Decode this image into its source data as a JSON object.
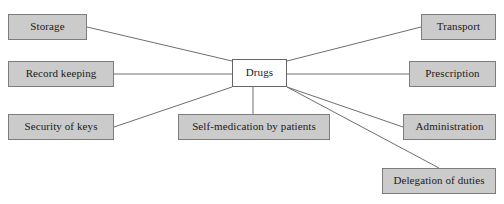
{
  "diagram": {
    "type": "spider-diagram",
    "title": "Drugs",
    "canvas": {
      "width": 504,
      "height": 204,
      "background": "#ffffff"
    },
    "style": {
      "node_fill": "#cbcbcb",
      "node_border": "#7d7d7d",
      "center_fill": "#ffffff",
      "center_border": "#666666",
      "edge_color": "#6e6e6e",
      "text_color": "#1a1a1a"
    },
    "center": {
      "label": "Drugs",
      "x": 232,
      "y": 59,
      "width": 55,
      "height": 28
    },
    "nodes": [
      {
        "id": "storage",
        "label": "Storage",
        "x": 8,
        "y": 14,
        "width": 79,
        "height": 26
      },
      {
        "id": "record-keeping",
        "label": "Record keeping",
        "x": 8,
        "y": 61,
        "width": 106,
        "height": 26
      },
      {
        "id": "security-of-keys",
        "label": "Security of keys",
        "x": 8,
        "y": 114,
        "width": 106,
        "height": 26
      },
      {
        "id": "self-medication",
        "label": "Self-medication by patients",
        "x": 178,
        "y": 114,
        "width": 152,
        "height": 26
      },
      {
        "id": "transport",
        "label": "Transport",
        "x": 421,
        "y": 14,
        "width": 75,
        "height": 26
      },
      {
        "id": "prescription",
        "label": "Prescription",
        "x": 409,
        "y": 61,
        "width": 87,
        "height": 26
      },
      {
        "id": "administration",
        "label": "Administration",
        "x": 403,
        "y": 114,
        "width": 93,
        "height": 26
      },
      {
        "id": "delegation",
        "label": "Delegation of duties",
        "x": 382,
        "y": 168,
        "width": 114,
        "height": 26
      }
    ],
    "edges": [
      {
        "id": "edge-storage",
        "from": "drugs",
        "to": "storage",
        "x1": 232,
        "y1": 61,
        "x2": 87,
        "y2": 27
      },
      {
        "id": "edge-record-keeping",
        "from": "drugs",
        "to": "record-keeping",
        "x1": 232,
        "y1": 74,
        "x2": 114,
        "y2": 74
      },
      {
        "id": "edge-security-of-keys",
        "from": "drugs",
        "to": "security-of-keys",
        "x1": 232,
        "y1": 87,
        "x2": 114,
        "y2": 127
      },
      {
        "id": "edge-self-medication",
        "from": "drugs",
        "to": "self-medication",
        "x1": 253,
        "y1": 87,
        "x2": 253,
        "y2": 114
      },
      {
        "id": "edge-transport",
        "from": "drugs",
        "to": "transport",
        "x1": 287,
        "y1": 61,
        "x2": 421,
        "y2": 27
      },
      {
        "id": "edge-prescription",
        "from": "drugs",
        "to": "prescription",
        "x1": 287,
        "y1": 74,
        "x2": 409,
        "y2": 74
      },
      {
        "id": "edge-administration",
        "from": "drugs",
        "to": "administration",
        "x1": 287,
        "y1": 87,
        "x2": 403,
        "y2": 127
      },
      {
        "id": "edge-delegation",
        "from": "drugs",
        "to": "delegation",
        "x1": 287,
        "y1": 87,
        "x2": 439,
        "y2": 168
      }
    ]
  }
}
